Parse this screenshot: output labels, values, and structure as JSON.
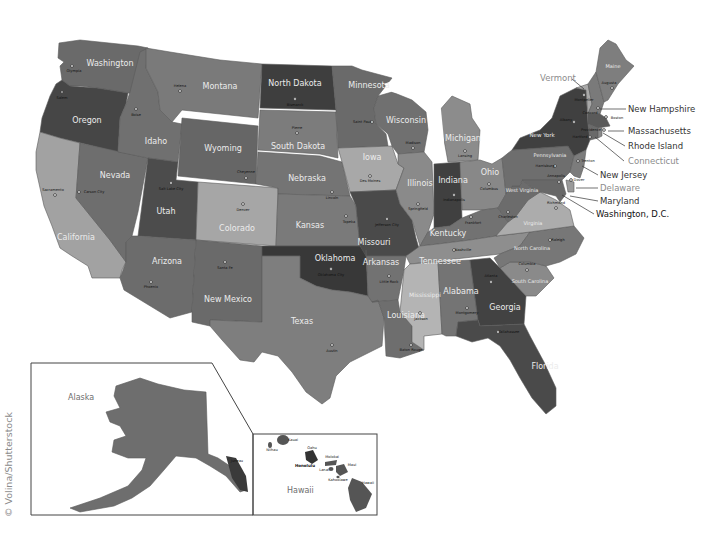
{
  "map": {
    "title": "United States map with states and capitals",
    "credit": "© Volina/Shutterstock",
    "palette": {
      "very_dark": "#3c3c3c",
      "dark": "#4e4e4e",
      "medium_dark": "#5e5e5e",
      "medium": "#6f6f6f",
      "medium_light": "#808080",
      "light": "#9c9c9c",
      "very_light": "#b6b6b6",
      "water": "#ffffff"
    },
    "states": [
      {
        "id": "WA",
        "name": "Washington",
        "capital": "Olympia"
      },
      {
        "id": "OR",
        "name": "Oregon",
        "capital": "Salem"
      },
      {
        "id": "CA",
        "name": "California",
        "capital": "Sacramento"
      },
      {
        "id": "NV",
        "name": "Nevada",
        "capital": "Carson City"
      },
      {
        "id": "ID",
        "name": "Idaho",
        "capital": "Boise"
      },
      {
        "id": "MT",
        "name": "Montana",
        "capital": "Helena"
      },
      {
        "id": "WY",
        "name": "Wyoming",
        "capital": "Cheyenne"
      },
      {
        "id": "UT",
        "name": "Utah",
        "capital": "Salt Lake City"
      },
      {
        "id": "AZ",
        "name": "Arizona",
        "capital": "Phoenix"
      },
      {
        "id": "CO",
        "name": "Colorado",
        "capital": "Denver"
      },
      {
        "id": "NM",
        "name": "New Mexico",
        "capital": "Santa Fe"
      },
      {
        "id": "ND",
        "name": "North Dakota",
        "capital": "Bismarck"
      },
      {
        "id": "SD",
        "name": "South Dakota",
        "capital": "Pierre"
      },
      {
        "id": "NE",
        "name": "Nebraska",
        "capital": "Lincoln"
      },
      {
        "id": "KS",
        "name": "Kansas",
        "capital": "Topeka"
      },
      {
        "id": "OK",
        "name": "Oklahoma",
        "capital": "Oklahoma City"
      },
      {
        "id": "TX",
        "name": "Texas",
        "capital": "Austin"
      },
      {
        "id": "MN",
        "name": "Minnesota",
        "capital": "Saint Paul"
      },
      {
        "id": "IA",
        "name": "Iowa",
        "capital": "Des Moines"
      },
      {
        "id": "MO",
        "name": "Missouri",
        "capital": "Jefferson City"
      },
      {
        "id": "AR",
        "name": "Arkansas",
        "capital": "Little Rock"
      },
      {
        "id": "LA",
        "name": "Louisiana",
        "capital": "Baton Rouge"
      },
      {
        "id": "WI",
        "name": "Wisconsin",
        "capital": "Madison"
      },
      {
        "id": "IL",
        "name": "Illinois",
        "capital": "Springfield"
      },
      {
        "id": "MI",
        "name": "Michigan",
        "capital": "Lansing"
      },
      {
        "id": "IN",
        "name": "Indiana",
        "capital": "Indianapolis"
      },
      {
        "id": "OH",
        "name": "Ohio",
        "capital": "Columbus"
      },
      {
        "id": "KY",
        "name": "Kentucky",
        "capital": "Frankfort"
      },
      {
        "id": "TN",
        "name": "Tennessee",
        "capital": "Nashville"
      },
      {
        "id": "MS",
        "name": "Mississippi",
        "capital": "Jackson"
      },
      {
        "id": "AL",
        "name": "Alabama",
        "capital": "Montgomery"
      },
      {
        "id": "GA",
        "name": "Georgia",
        "capital": "Atlanta"
      },
      {
        "id": "FL",
        "name": "Florida",
        "capital": "Tallahassee"
      },
      {
        "id": "SC",
        "name": "South Carolina",
        "capital": "Columbia"
      },
      {
        "id": "NC",
        "name": "North Carolina",
        "capital": "Raleigh"
      },
      {
        "id": "VA",
        "name": "Virginia",
        "capital": "Richmond"
      },
      {
        "id": "WV",
        "name": "West Virginia",
        "capital": "Charleston"
      },
      {
        "id": "PA",
        "name": "Pennsylvania",
        "capital": "Harrisburg"
      },
      {
        "id": "NY",
        "name": "New York",
        "capital": "Albany"
      },
      {
        "id": "VT",
        "name": "Vermont",
        "capital": "Montpelier"
      },
      {
        "id": "NH",
        "name": "New Hampshire",
        "capital": "Concord"
      },
      {
        "id": "ME",
        "name": "Maine",
        "capital": "Augusta"
      },
      {
        "id": "MA",
        "name": "Massachusetts",
        "capital": "Boston"
      },
      {
        "id": "RI",
        "name": "Rhode Island",
        "capital": "Providence"
      },
      {
        "id": "CT",
        "name": "Connecticut",
        "capital": "Hartford"
      },
      {
        "id": "NJ",
        "name": "New Jersey",
        "capital": "Trenton"
      },
      {
        "id": "DE",
        "name": "Delaware",
        "capital": "Dover"
      },
      {
        "id": "MD",
        "name": "Maryland",
        "capital": "Annapolis"
      },
      {
        "id": "AK",
        "name": "Alaska",
        "capital": "Juneau"
      },
      {
        "id": "HI",
        "name": "Hawaii",
        "capital": "Honolulu"
      }
    ],
    "callouts": [
      {
        "label": "Vermont",
        "color": "#8c8c8c"
      },
      {
        "label": "New Hampshire",
        "color": "#333333"
      },
      {
        "label": "Massachusetts",
        "color": "#333333"
      },
      {
        "label": "Rhode Island",
        "color": "#333333"
      },
      {
        "label": "Connecticut",
        "color": "#8c8c8c"
      },
      {
        "label": "New Jersey",
        "color": "#333333"
      },
      {
        "label": "Delaware",
        "color": "#8c8c8c"
      },
      {
        "label": "Maryland",
        "color": "#333333"
      },
      {
        "label": "Washington, D.C.",
        "color": "#111111"
      }
    ],
    "hawaii_islands": [
      "Niihau",
      "Kauai",
      "Oahu",
      "Molokai",
      "Lanai",
      "Maui",
      "Kahoolawe",
      "Hawaii"
    ],
    "insets": {
      "alaska_label": "Alaska",
      "hawaii_label": "Hawaii"
    }
  }
}
